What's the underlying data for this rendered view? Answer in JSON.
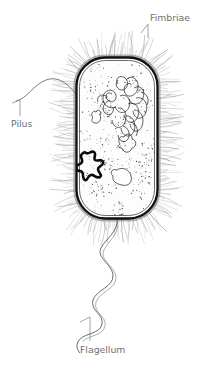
{
  "figure": {
    "organism_shape": "rod-shaped bacillus",
    "style": "black-and-white pen line drawing",
    "background_color": "#ffffff",
    "ink_color": "#1a1a1a",
    "fine_line_color": "#8a8a8a",
    "label_color": "#6f6f6f",
    "width": 207,
    "height": 366
  },
  "labels": [
    {
      "id": "fimbriae",
      "text": "Fimbriae",
      "position": "top-right",
      "text_x": 150,
      "text_y": 21,
      "anchor": "start",
      "leader": {
        "x1": 148,
        "y1": 24,
        "x2": 141,
        "y2": 31,
        "tick_x": 148,
        "tick_y1": 24,
        "tick_y2": 38
      }
    },
    {
      "id": "pilus",
      "text": "Pilus",
      "position": "left",
      "text_x": 11,
      "text_y": 125,
      "anchor": "start",
      "leader": {
        "x1": 20,
        "y1": 100,
        "x2": 13,
        "y2": 103,
        "tick_x": 20,
        "tick_y1": 100,
        "tick_y2": 115
      }
    },
    {
      "id": "flagellum",
      "text": "Flagellum",
      "position": "bottom-center",
      "text_x": 80,
      "text_y": 352,
      "anchor": "start",
      "leader": {
        "x1": 90,
        "y1": 317,
        "x2": 81,
        "y2": 321,
        "tick_x": 90,
        "tick_y1": 317,
        "tick_y2": 341
      }
    }
  ],
  "structures": [
    {
      "id": "cell-envelope",
      "name": "cell envelope / cell wall",
      "described_as": "thick dark outer boundary with thin inner membrane line",
      "bounds": {
        "x": 74,
        "y": 55,
        "width": 86,
        "height": 166,
        "corner_radius": 30
      }
    },
    {
      "id": "cytoplasm",
      "name": "cytoplasm",
      "described_as": "pale interior filled with fine stipple dots"
    },
    {
      "id": "nucleoid",
      "name": "nucleoid (tangled DNA loops)",
      "described_as": "cluster of thin overlapping loops in upper-right interior",
      "center_x": 122,
      "center_y": 104
    },
    {
      "id": "plasmid",
      "name": "plasmid",
      "described_as": "small bold closed star-shaped loop against inner left wall",
      "center_x": 88,
      "center_y": 165
    },
    {
      "id": "ribosomes",
      "name": "ribosomes",
      "described_as": "dense scattered black stipple dots throughout cytoplasm",
      "count_approx": 420
    },
    {
      "id": "inclusion-bodies",
      "name": "inclusion bodies",
      "described_as": "three irregular blob outlines in the cytoplasm"
    },
    {
      "id": "fimbriae-hairs",
      "name": "fimbriae",
      "described_as": "dense fine gray hair-like projections radiating from entire cell surface",
      "count_approx": 210
    },
    {
      "id": "pilus-filament",
      "name": "pilus",
      "described_as": "single long smooth curved filament extending up-left from the cell"
    },
    {
      "id": "flagellum-filament",
      "name": "flagellum",
      "described_as": "long wavy sinusoidal filament trailing from the bottom of the cell"
    }
  ]
}
